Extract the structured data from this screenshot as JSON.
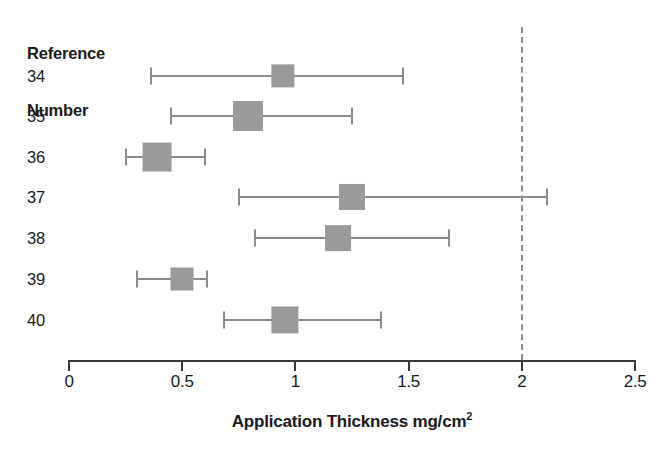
{
  "chart_data": {
    "type": "forest",
    "title": "",
    "xlabel": "Application Thickness mg/cm",
    "xlabel_superscript": "2",
    "ylabel": "",
    "row_header": [
      "Reference",
      "Number"
    ],
    "xlim": [
      0,
      2.5
    ],
    "xticks": [
      0,
      0.5,
      1,
      1.5,
      2,
      2.5
    ],
    "xtick_labels": [
      "0",
      "0.5",
      "1",
      "1.5",
      "2",
      "2.5"
    ],
    "grid": false,
    "legend": "none",
    "reference_line": {
      "value": 2,
      "style": "dashed",
      "color": "#8c8c8c"
    },
    "marker_color": "#9a9a9a",
    "line_color": "#8c8c8c",
    "categories": [
      "34",
      "35",
      "36",
      "37",
      "38",
      "39",
      "40"
    ],
    "rows": [
      {
        "label": "34",
        "center": 0.945,
        "low": 0.36,
        "high": 1.475,
        "box_size": 0.52
      },
      {
        "label": "35",
        "center": 0.79,
        "low": 0.45,
        "high": 1.25,
        "box_size": 1.0
      },
      {
        "label": "36",
        "center": 0.39,
        "low": 0.25,
        "high": 0.6,
        "box_size": 0.92
      },
      {
        "label": "37",
        "center": 1.25,
        "low": 0.75,
        "high": 2.11,
        "box_size": 0.72
      },
      {
        "label": "38",
        "center": 1.19,
        "low": 0.82,
        "high": 1.68,
        "box_size": 0.7
      },
      {
        "label": "39",
        "center": 0.5,
        "low": 0.3,
        "high": 0.61,
        "box_size": 0.5
      },
      {
        "label": "40",
        "center": 0.955,
        "low": 0.685,
        "high": 1.38,
        "box_size": 0.8
      }
    ]
  },
  "geometry": {
    "x0_px": 69,
    "x_scale_px_per_unit": 226.4,
    "row_y_px": [
      76,
      116,
      157,
      197,
      238,
      279,
      320
    ],
    "axis_y_px": 360,
    "tick_len_px": 11,
    "tick_label_y_px": 372,
    "axis_title_y_px": 410,
    "ref_line_top_px": 27,
    "ref_line_bottom_px": 360,
    "box_max_px": 30,
    "box_min_px": 16
  }
}
